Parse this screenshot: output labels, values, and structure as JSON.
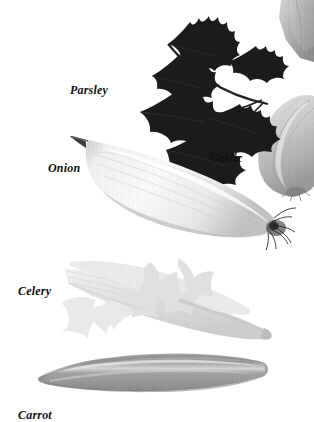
{
  "plate": {
    "background_color": "#ffffff",
    "style": "grayscale photographic plate",
    "label_color": "#111111"
  },
  "specimens": [
    {
      "name": "parsley",
      "label": "Parsley",
      "label_x": 70,
      "label_y": 84,
      "label_size": 12,
      "tone": "#1b1b1b",
      "description": "dark serrated compound leaf, upper center"
    },
    {
      "name": "onion",
      "label": "Onion",
      "label_x": 48,
      "label_y": 162,
      "label_size": 12,
      "tone": "#efefef",
      "description": "elongated tapered pale bulb with dark roots at right"
    },
    {
      "name": "garlic",
      "label": "Garlic",
      "label_x": 210,
      "label_y": 152,
      "label_size": 12,
      "tone": "#c9c9c9",
      "description": "papery bulb at right edge, partially cropped"
    },
    {
      "name": "celery",
      "label": "Celery",
      "label_x": 18,
      "label_y": 285,
      "label_size": 12,
      "tone": "#e2e2e2",
      "description": "pale ribbed stalks with leafy fronds"
    },
    {
      "name": "carrot",
      "label": "Carrot",
      "label_x": 18,
      "label_y": 409,
      "label_size": 12,
      "tone": "#9a9a9a",
      "description": "mid-gray striated root, bottom of plate"
    },
    {
      "name": "leek",
      "label": "",
      "tone": "#b6b6b6",
      "description": "unlabeled partial stalk cropped at top-right corner"
    }
  ]
}
